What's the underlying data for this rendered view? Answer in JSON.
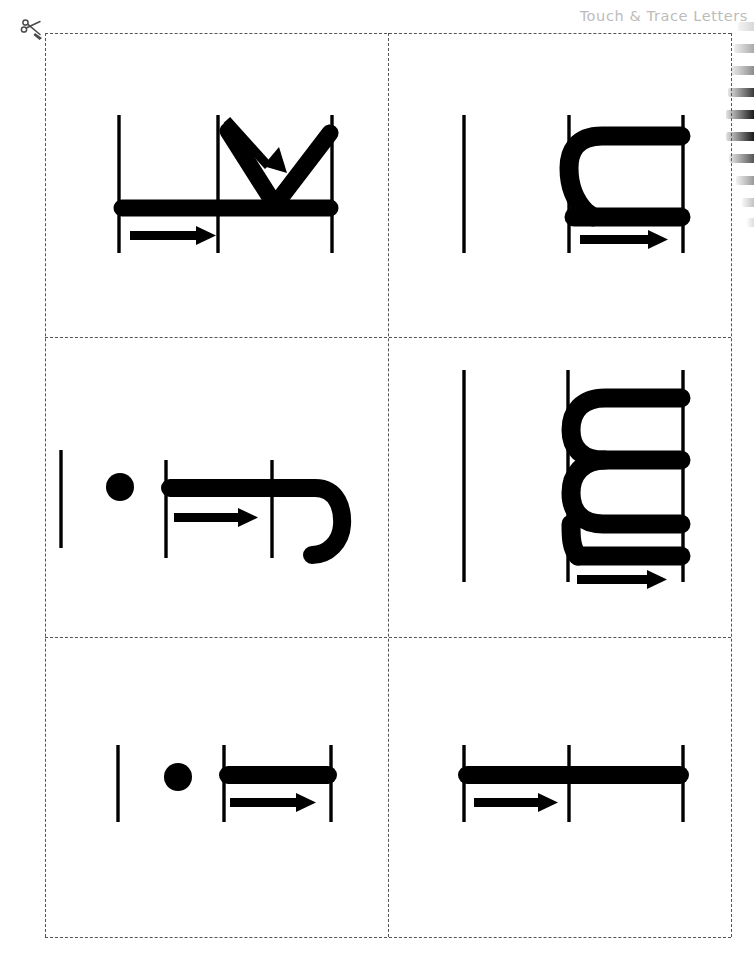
{
  "page": {
    "width": 756,
    "height": 962,
    "background": "#ffffff",
    "ink_color": "#000000",
    "header_color": "#bcbcbc",
    "cut_line_color": "#555555"
  },
  "header": {
    "title": "Touch & Trace Letters",
    "truncated": true
  },
  "cut_marker": {
    "icon": "scissors-icon",
    "label": "cut along dashed line"
  },
  "binding": {
    "icon": "spiral-binding-icon",
    "coil_count": 9,
    "edge": "right"
  },
  "grid": {
    "columns": 2,
    "rows": 3,
    "left": 45,
    "top": 33,
    "width": 686,
    "height": 904,
    "v_divider_x": 343,
    "h_divider_y": [
      304,
      604
    ]
  },
  "cards": [
    {
      "id": "card-w",
      "letter": "w",
      "letter_case": "lowercase",
      "orientation": "rotated-180",
      "row": 1,
      "column": 1,
      "guide_lines": 3,
      "stroke_arrows": [
        "arrow-right-baseline",
        "arrow-diagonal-down-right"
      ],
      "has_dot": false
    },
    {
      "id": "card-n",
      "letter": "n",
      "letter_case": "lowercase",
      "orientation": "rotated-180",
      "row": 1,
      "column": 2,
      "guide_lines": 3,
      "stroke_arrows": [
        "arrow-right-baseline"
      ],
      "has_dot": false
    },
    {
      "id": "card-f",
      "letter": "f",
      "letter_case": "lowercase",
      "orientation": "rotated-180",
      "row": 2,
      "column": 1,
      "guide_lines": 3,
      "stroke_arrows": [
        "arrow-right-crossbar"
      ],
      "has_dot": true
    },
    {
      "id": "card-m",
      "letter": "m",
      "letter_case": "lowercase",
      "orientation": "rotated-180",
      "row": 2,
      "column": 2,
      "guide_lines": 3,
      "stroke_arrows": [
        "arrow-right-baseline"
      ],
      "has_dot": false
    },
    {
      "id": "card-i",
      "letter": "i",
      "letter_case": "lowercase",
      "orientation": "rotated-180",
      "row": 3,
      "column": 1,
      "guide_lines": 2,
      "stroke_arrows": [
        "arrow-right-baseline"
      ],
      "has_dot": true
    },
    {
      "id": "card-t",
      "letter": "t",
      "letter_case": "lowercase",
      "orientation": "rotated-180",
      "row": 3,
      "column": 2,
      "guide_lines": 3,
      "stroke_arrows": [
        "arrow-right-baseline"
      ],
      "has_dot": false
    }
  ]
}
